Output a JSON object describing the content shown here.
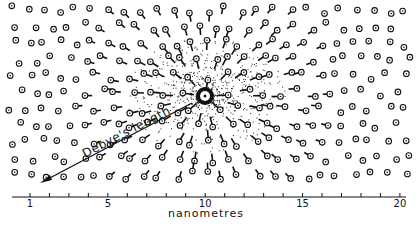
{
  "figure": {
    "annotation": "Debye's length",
    "axis": {
      "label": "nanometres",
      "tick_labels": [
        {
          "value": 1,
          "text": "1"
        },
        {
          "value": 5,
          "text": "5"
        },
        {
          "value": 10,
          "text": "10"
        },
        {
          "value": 15,
          "text": "15"
        },
        {
          "value": 20,
          "text": "20"
        }
      ],
      "range": [
        0,
        20
      ],
      "minor_tick_step": 1
    },
    "central_ion": {
      "symbol": "positive-ion",
      "x_nm": 10
    },
    "particle_symbol": "circled-dot ion with pointer toward center",
    "colors": {
      "ink": "#111111",
      "background": "#ffffff"
    }
  }
}
